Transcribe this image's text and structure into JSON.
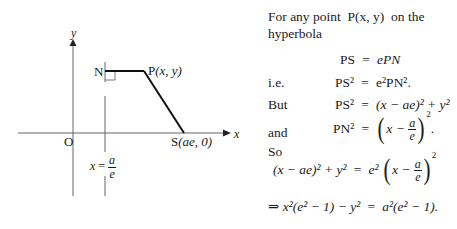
{
  "diagram": {
    "axis_labels": {
      "y": "y",
      "x": "x",
      "origin": "O"
    },
    "points": {
      "N": "N",
      "P": {
        "name": "P",
        "coords": "(x, y)"
      },
      "S": {
        "name": "S",
        "coords": "(ae, 0)"
      }
    },
    "directrix": {
      "lhs": "x",
      "eq": "=",
      "num": "a",
      "den": "e"
    }
  },
  "text": {
    "intro_line1": "For any point",
    "intro_point": "P(x, y)",
    "intro_line1_end": "on the",
    "intro_line2": "hyperbola",
    "lines": [
      {
        "label": "",
        "lhs": "PS",
        "rhs": "ePN"
      },
      {
        "label": "i.e.",
        "lhs": "PS²",
        "rhs": "e²PN²."
      },
      {
        "label": "But",
        "lhs": "PS²",
        "rhs": "(x − ae)² + y²"
      },
      {
        "label": "and",
        "lhs": "PN²",
        "rhs_inner": "x −",
        "rhs_num": "a",
        "rhs_den": "e",
        "rhs_exp": "2",
        "rhs_end": "."
      },
      {
        "label": "So"
      },
      {
        "lhs": "(x − ae)² + y²",
        "rhs_coef": "e²",
        "rhs_inner": "x −",
        "rhs_num": "a",
        "rhs_den": "e",
        "rhs_exp": "2"
      },
      {
        "prefix": "⇒",
        "lhs": "x²(e² − 1) − y²",
        "rhs": "a²(e² − 1)."
      }
    ],
    "equals": "="
  }
}
